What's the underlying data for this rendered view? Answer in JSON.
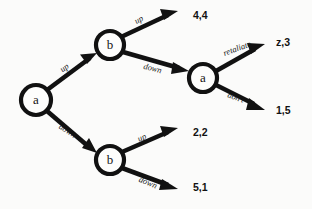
{
  "diagram": {
    "background_color": "#fbfbfa",
    "ink_color": "#111111",
    "nodes": [
      {
        "id": "root-a",
        "label": "a",
        "x": 36,
        "y": 100,
        "r": 15
      },
      {
        "id": "upper-b",
        "label": "b",
        "x": 110,
        "y": 45,
        "r": 14
      },
      {
        "id": "lower-b",
        "label": "b",
        "x": 110,
        "y": 160,
        "r": 14
      },
      {
        "id": "second-a",
        "label": "a",
        "x": 203,
        "y": 78,
        "r": 14
      }
    ],
    "edges": [
      {
        "id": "root-up",
        "label": "up",
        "from": "root-a",
        "to": "upper-b",
        "label_x": 66,
        "label_y": 70,
        "rotate": -36
      },
      {
        "id": "root-down",
        "label": "down",
        "from": "root-a",
        "to": "lower-b",
        "label_x": 66,
        "label_y": 133,
        "rotate": 33
      },
      {
        "id": "upper-b-up",
        "label": "up",
        "from": "upper-b",
        "to": "payoff-44",
        "label_x": 140,
        "label_y": 22,
        "rotate": -27
      },
      {
        "id": "upper-b-down",
        "label": "down",
        "from": "upper-b",
        "to": "second-a",
        "label_x": 152,
        "label_y": 71,
        "rotate": 14
      },
      {
        "id": "second-a-retaliate",
        "label": "retaliate",
        "from": "second-a",
        "to": "payoff-z3",
        "label_x": 238,
        "label_y": 51,
        "rotate": -20
      },
      {
        "id": "second-a-dont",
        "label": "don't",
        "from": "second-a",
        "to": "payoff-15",
        "label_x": 235,
        "label_y": 100,
        "rotate": 20
      },
      {
        "id": "lower-b-up",
        "label": "up",
        "from": "lower-b",
        "to": "payoff-22",
        "label_x": 143,
        "label_y": 140,
        "rotate": -24
      },
      {
        "id": "lower-b-down",
        "label": "down",
        "from": "lower-b",
        "to": "payoff-51",
        "label_x": 147,
        "label_y": 185,
        "rotate": 22
      }
    ],
    "payoffs": [
      {
        "id": "payoff-44",
        "label": "4,4",
        "x": 193,
        "y": 16
      },
      {
        "id": "payoff-z3",
        "label": "z,3",
        "x": 276,
        "y": 43
      },
      {
        "id": "payoff-15",
        "label": "1,5",
        "x": 276,
        "y": 111
      },
      {
        "id": "payoff-22",
        "label": "2,2",
        "x": 193,
        "y": 133
      },
      {
        "id": "payoff-51",
        "label": "5,1",
        "x": 193,
        "y": 188
      }
    ]
  }
}
